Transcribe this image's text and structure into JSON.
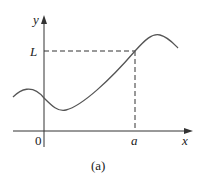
{
  "figure": {
    "caption": "(a)",
    "axes": {
      "x_label": "x",
      "y_label": "y",
      "origin_label": "0"
    },
    "marks": {
      "x_mark": "a",
      "y_mark": "L"
    },
    "colors": {
      "curve": "#555555",
      "axes": "#333333",
      "dashed": "#333333"
    }
  }
}
